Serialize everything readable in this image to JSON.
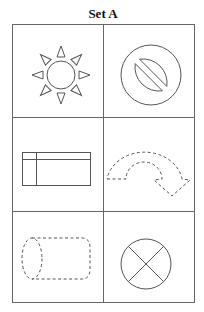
{
  "title": "Set A",
  "colors": {
    "stroke": "#555555",
    "grid": "#666666",
    "background": "#ffffff"
  },
  "grid": {
    "rows": 3,
    "columns": 2,
    "cells": [
      {
        "row": 1,
        "col": 1,
        "symbol": "sun-icon",
        "description": "Sun with circle and eight triangular rays",
        "line_style": "solid"
      },
      {
        "row": 1,
        "col": 2,
        "symbol": "prohibition-icon",
        "description": "Circle with diagonal slash (no symbol)",
        "line_style": "solid"
      },
      {
        "row": 2,
        "col": 1,
        "symbol": "internal-storage-icon",
        "description": "Rectangle with horizontal and vertical inner lines",
        "line_style": "solid"
      },
      {
        "row": 2,
        "col": 2,
        "symbol": "u-turn-arrow-icon",
        "description": "Curved U-turn arrow",
        "line_style": "dashed"
      },
      {
        "row": 3,
        "col": 1,
        "symbol": "cylinder-icon",
        "description": "Horizontal cylinder (direct access storage)",
        "line_style": "dashed"
      },
      {
        "row": 3,
        "col": 2,
        "symbol": "summing-junction-icon",
        "description": "Circle with X (summing junction)",
        "line_style": "solid"
      }
    ]
  }
}
